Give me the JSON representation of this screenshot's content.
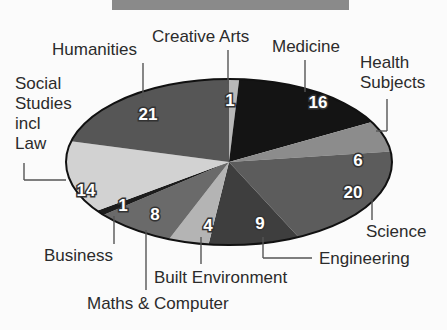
{
  "chart_data": {
    "type": "pie",
    "title": "",
    "style": "3d-ellipse, grayscale",
    "categories": [
      "Creative Arts",
      "Medicine",
      "Health Subjects",
      "Science",
      "Engineering",
      "Built Environment",
      "Maths & Computer",
      "Business",
      "Social Studies incl Law",
      "Humanities"
    ],
    "values": [
      1,
      16,
      6,
      20,
      9,
      4,
      8,
      1,
      14,
      21
    ],
    "colors": [
      "#b8b8b8",
      "#141414",
      "#8c8c8c",
      "#5c5c5c",
      "#3e3e3e",
      "#b4b4b4",
      "#6a6a6a",
      "#1c1c1c",
      "#d2d2d2",
      "#565656"
    ],
    "start_angle_deg": -90,
    "direction": "clockwise",
    "ellipse": {
      "cx": 229,
      "cy": 162,
      "rx": 163,
      "ry": 83
    },
    "value_label_positions": [
      [
        230,
        106
      ],
      [
        318,
        108
      ],
      [
        358,
        166
      ],
      [
        353,
        198
      ],
      [
        260,
        229
      ],
      [
        208,
        231
      ],
      [
        155,
        220
      ],
      [
        123,
        211
      ],
      [
        86,
        196
      ],
      [
        148,
        120
      ]
    ]
  },
  "labels": {
    "creative_arts": "Creative Arts",
    "medicine": "Medicine",
    "health_1": "Health",
    "health_2": "Subjects",
    "humanities": "Humanities",
    "social_1": "Social",
    "social_2": "Studies",
    "social_3": "incl",
    "social_4": "Law",
    "business": "Business",
    "maths": "Maths & Computer",
    "built": "Built Environment",
    "engineering": "Engineering",
    "science": "Science"
  }
}
